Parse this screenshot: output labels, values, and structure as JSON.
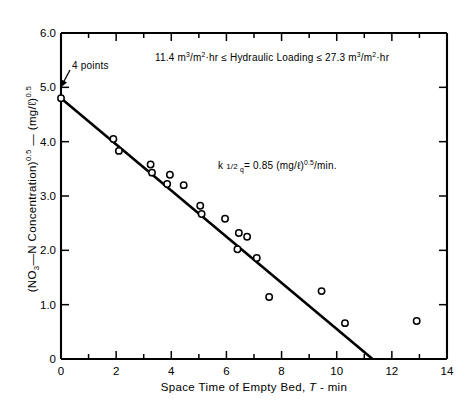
{
  "chart_data": {
    "type": "scatter",
    "title": "",
    "xlabel": "Space Time of Empty Bed, T - min",
    "ylabel": "(NO3-N Concentration)0.5 - (mg/l)0.5",
    "xlim": [
      0,
      14
    ],
    "ylim": [
      0,
      6.0
    ],
    "xticks": [
      0,
      2,
      4,
      6,
      8,
      10,
      12,
      14
    ],
    "xtick_labels": [
      "0",
      "2",
      "4",
      "6",
      "8",
      "10",
      "12",
      "14"
    ],
    "xminor_step": 1,
    "yticks": [
      0,
      1.0,
      2.0,
      3.0,
      4.0,
      5.0,
      6.0
    ],
    "ytick_labels": [
      "0",
      "1.0",
      "2.0",
      "3.0",
      "4.0",
      "5.0",
      "6.0"
    ],
    "grid": false,
    "legend": null,
    "marker": "open-circle",
    "points": [
      {
        "x": 0.0,
        "y": 4.8,
        "note": "4 points"
      },
      {
        "x": 1.9,
        "y": 4.05
      },
      {
        "x": 2.1,
        "y": 3.83
      },
      {
        "x": 3.25,
        "y": 3.58
      },
      {
        "x": 3.3,
        "y": 3.43
      },
      {
        "x": 3.95,
        "y": 3.39
      },
      {
        "x": 3.85,
        "y": 3.22
      },
      {
        "x": 4.45,
        "y": 3.2
      },
      {
        "x": 5.05,
        "y": 2.82
      },
      {
        "x": 5.1,
        "y": 2.67
      },
      {
        "x": 5.95,
        "y": 2.58
      },
      {
        "x": 6.45,
        "y": 2.32
      },
      {
        "x": 6.75,
        "y": 2.25
      },
      {
        "x": 6.4,
        "y": 2.02
      },
      {
        "x": 7.1,
        "y": 1.86
      },
      {
        "x": 7.55,
        "y": 1.14
      },
      {
        "x": 9.45,
        "y": 1.25
      },
      {
        "x": 10.3,
        "y": 0.66
      },
      {
        "x": 12.9,
        "y": 0.7
      }
    ],
    "fit_line": {
      "x0": 0.0,
      "y0": 4.8,
      "x1": 11.3,
      "y1": 0.0
    }
  },
  "annotations": {
    "points_label": "4 points",
    "hydraulic_loading": "11.4 m3/m2·hr ≤ Hydraulic Loading ≤ 27.3 m3/m2·hr",
    "rate_constant": "k 1/2 q = 0.85 (mg/l)0.5/min."
  },
  "axis_text": {
    "x_title": "Space Time of Empty Bed, T - min",
    "y_title_main": "(NO3-N Concentration)0.5",
    "y_title_units": "(mg/l)0.5"
  }
}
